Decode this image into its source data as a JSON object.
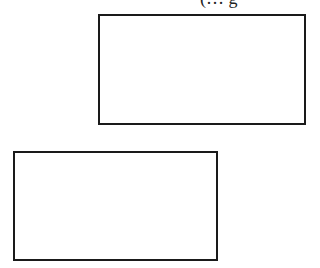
{
  "caption": {
    "text": "(… g"
  },
  "boxes": [
    {
      "id": "box1",
      "label": ""
    },
    {
      "id": "box2",
      "label": ""
    }
  ],
  "colors": {
    "border": "#1a1a1a",
    "background": "#ffffff"
  }
}
